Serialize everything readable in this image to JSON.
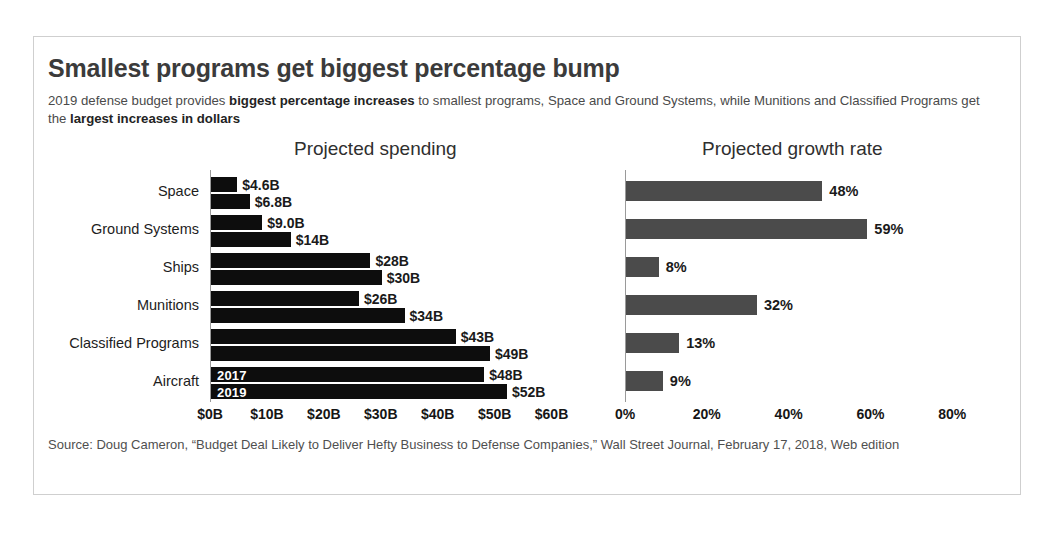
{
  "scan": {
    "top_fragment": ""
  },
  "figure": {
    "title": "Smallest programs get biggest percentage bump",
    "subtitle_part1": "2019 defense budget provides ",
    "subtitle_bold1": "biggest percentage increases",
    "subtitle_part2": " to smallest programs, Space and Ground Systems, while Munitions and Classified Programs get the ",
    "subtitle_bold2": "largest increases in dollars",
    "source": "Source: Doug Cameron, “Budget Deal Likely to Deliver Hefty Business to Defense Companies,” Wall Street Journal, February 17, 2018, Web edition"
  },
  "panels": {
    "left_heading": "Projected spending",
    "right_heading": "Projected growth rate"
  },
  "legend": {
    "series_2017": "2017",
    "series_2019": "2019"
  },
  "chart_data": [
    {
      "type": "bar",
      "title": "Projected spending",
      "orientation": "horizontal",
      "categories": [
        "Space",
        "Ground Systems",
        "Ships",
        "Munitions",
        "Classified Programs",
        "Aircraft"
      ],
      "series": [
        {
          "name": "2017",
          "values": [
            4.6,
            9.0,
            28,
            26,
            43,
            48
          ],
          "labels": [
            "$4.6B",
            "$9.0B",
            "$28B",
            "$26B",
            "$43B",
            "$48B"
          ],
          "color": "#0d0d0d"
        },
        {
          "name": "2019",
          "values": [
            6.8,
            14,
            30,
            34,
            49,
            52
          ],
          "labels": [
            "$6.8B",
            "$14B",
            "$30B",
            "$34B",
            "$49B",
            "$52B"
          ],
          "color": "#0d0d0d"
        }
      ],
      "xlabel": "",
      "ylabel": "",
      "xlim": [
        0,
        65
      ],
      "xticks": [
        0,
        10,
        20,
        30,
        40,
        50,
        60
      ],
      "xticklabels": [
        "$0B",
        "$10B",
        "$20B",
        "$30B",
        "$40B",
        "$50B",
        "$60B"
      ],
      "grid": false,
      "legend": "inline-on-bars"
    },
    {
      "type": "bar",
      "title": "Projected growth rate",
      "orientation": "horizontal",
      "categories": [
        "Space",
        "Ground Systems",
        "Ships",
        "Munitions",
        "Classified Programs",
        "Aircraft"
      ],
      "values": [
        48,
        59,
        8,
        32,
        13,
        9
      ],
      "labels": [
        "48%",
        "59%",
        "8%",
        "32%",
        "13%",
        "9%"
      ],
      "color": "#4b4b4b",
      "xlabel": "",
      "ylabel": "",
      "xlim": [
        0,
        88
      ],
      "xticks": [
        0,
        20,
        40,
        60,
        80
      ],
      "xticklabels": [
        "0%",
        "20%",
        "40%",
        "60%",
        "80%"
      ],
      "grid": false,
      "legend": "none"
    }
  ]
}
